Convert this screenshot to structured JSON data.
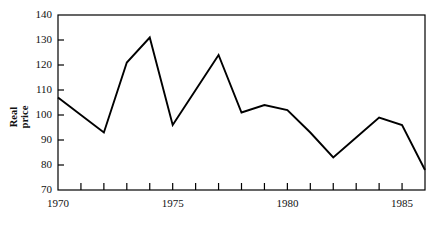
{
  "chart_data": {
    "type": "line",
    "title": "",
    "xlabel": "",
    "ylabel": "Real price",
    "ylabel_lines": [
      "Real",
      "price"
    ],
    "x": [
      1970,
      1971,
      1972,
      1973,
      1974,
      1975,
      1976,
      1977,
      1978,
      1979,
      1980,
      1981,
      1982,
      1983,
      1984,
      1985,
      1986
    ],
    "values": [
      107,
      100,
      93,
      121,
      131,
      96,
      110,
      124,
      101,
      104,
      102,
      93,
      83,
      91,
      99,
      96,
      78
    ],
    "xlim": [
      1970,
      1986
    ],
    "ylim": [
      70,
      140
    ],
    "ytick_values": [
      70,
      80,
      90,
      100,
      110,
      120,
      130,
      140
    ],
    "ytick_labels": [
      "70",
      "80",
      "90",
      "100",
      "110",
      "120",
      "130",
      "140"
    ],
    "xtick_values": [
      1970,
      1971,
      1972,
      1973,
      1974,
      1975,
      1976,
      1977,
      1978,
      1979,
      1980,
      1981,
      1982,
      1983,
      1984,
      1985,
      1986
    ],
    "xtick_labels_shown": [
      {
        "value": 1970,
        "label": "1970"
      },
      {
        "value": 1975,
        "label": "1975"
      },
      {
        "value": 1980,
        "label": "1980"
      },
      {
        "value": 1985,
        "label": "1985"
      }
    ],
    "grid": false,
    "legend": null,
    "line_color": "#000000",
    "axis_color": "#000000",
    "background_color": "#ffffff"
  }
}
